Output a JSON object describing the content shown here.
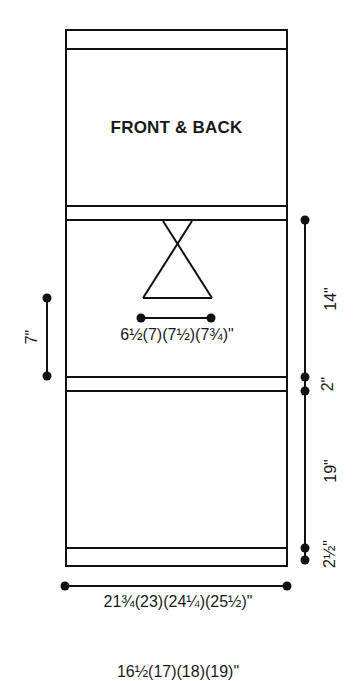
{
  "diagram": {
    "title": "FRONT & BACK",
    "neck_width": "6½(7)(7½)(7¾)\"",
    "width": "21¾(23)(24¼)(25½)\"",
    "bottom_partial": "16½(17)(18)(19)\"",
    "left_dim": "7\"",
    "right_dims": {
      "top": "14\"",
      "middle": "2\"",
      "lower": "19\"",
      "bottom": "2½\""
    },
    "colors": {
      "line": "#111111",
      "background": "#ffffff"
    }
  }
}
